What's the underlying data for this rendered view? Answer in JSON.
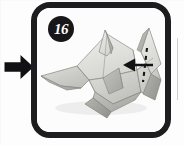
{
  "figure": {
    "kind": "origami-instruction-step",
    "step_number": "16",
    "badge_label": "16",
    "badge_shape": "circle",
    "badge_bg_color": "#171719",
    "badge_text_color": "#ffffff",
    "frame_color": "#1d1d1f",
    "frame_shape": "rounded-rectangle",
    "panel_bg_color": "#fcfcfc",
    "page_bg_color": "#ffffff"
  },
  "progression_arrow": {
    "icon": "arrow-right-icon",
    "direction": "right",
    "color": "#111113",
    "description": "solid black arrow pointing right into the step panel"
  },
  "model": {
    "subject": "paper shark",
    "paper_color_light": "#e8e8e6",
    "paper_color_mid": "#cfcfcb",
    "paper_color_shadow": "#aeaeaa",
    "paper_color_dark": "#9a9a96",
    "outline_color": "#6e6e6a"
  },
  "fold_annotation": {
    "icon": "arrow-left-icon",
    "arrow_direction": "left",
    "arrow_color": "#131315",
    "crease_style": "dashed",
    "crease_color": "#131315",
    "description": "leftward fold arrow crossing a vertical dashed crease line on the tail fin"
  },
  "artifacts": {
    "page_edge_line": "faint vertical scan line at right margin"
  }
}
